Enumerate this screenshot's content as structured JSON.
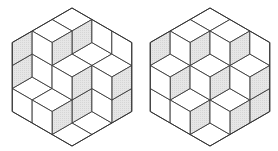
{
  "figure": {
    "colors": {
      "background": "#ffffff",
      "edge": "#3a3a3a",
      "shaded_face": "#e2e2e2",
      "top_face": "#ffffff",
      "right_face": "#ffffff"
    },
    "geometry": {
      "edge_length_px": 23,
      "center_y": 77
    },
    "box": {
      "a": 3,
      "b": 3,
      "c": 3
    },
    "tilings": [
      {
        "name": "left-tiling",
        "center_x": 72,
        "heights": [
          [
            3,
            3,
            1
          ],
          [
            2,
            2,
            1
          ],
          [
            2,
            0,
            0
          ]
        ]
      },
      {
        "name": "right-tiling",
        "center_x": 210,
        "heights": [
          [
            3,
            3,
            2
          ],
          [
            3,
            2,
            1
          ],
          [
            2,
            1,
            0
          ]
        ]
      }
    ]
  }
}
